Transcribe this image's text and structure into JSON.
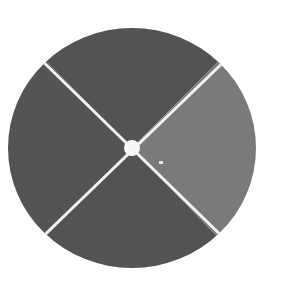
{
  "stimulus": {
    "shape": "circle",
    "quadrants": [
      {
        "position": "top",
        "color": "#535353"
      },
      {
        "position": "right",
        "color": "#7a7a7a"
      },
      {
        "position": "bottom",
        "color": "#535353"
      },
      {
        "position": "left",
        "color": "#545454"
      }
    ],
    "divider_color": "#f2f2f2",
    "center_dot_color": "#f7f7f7",
    "speck_color": "#e8e8e8"
  }
}
